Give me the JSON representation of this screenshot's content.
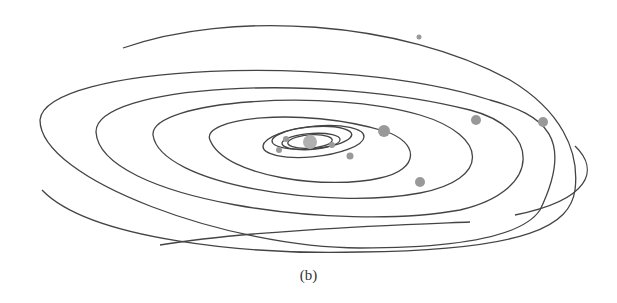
{
  "caption": "(b)",
  "colors": {
    "orbit": "#444444",
    "planet": "#999999",
    "sun": "#b0b0b0",
    "background": "#ffffff"
  },
  "sun": {
    "cx": 310,
    "cy": 142,
    "r": 7
  },
  "orbits": [
    {
      "d": "M 288,142 A 20,6 -4 1 1 332,141 A 20,6 -4 0 1 288,142"
    },
    {
      "d": "M 282,143 A 29,8 -4 1 1 340,140 A 29,8 -4 0 1 282,143"
    },
    {
      "d": "M 275,145 A 40,11 -5 1 1 350,138 A 40,11 -5 0 1 275,145"
    },
    {
      "d": "M 263,146 A 50,15 -6 1 1 364,137 A 50,15 -6 0 1 263,146"
    },
    {
      "d": "M 210,140 C 200,118 300,106 384,131 C 420,142 420,170 380,178 C 330,190 225,178 210,140"
    },
    {
      "d": "M 153,135 C 150,100 330,88 420,115 C 490,136 490,180 420,193 C 330,210 160,185 153,135"
    },
    {
      "d": "M 96,132 C 95,85 320,72 470,110 C 540,128 545,190 460,210 C 340,232 100,200 96,132"
    },
    {
      "d": "M 40,120 C 45,65 340,52 490,100 C 545,115 575,138 540,210 C 520,240 440,248 360,248 C 230,248 40,180 40,120"
    },
    {
      "d": "M 123,48 C 230,10 400,20 510,80 C 560,110 580,150 575,190 C 570,225 530,250 360,252"
    },
    {
      "d": "M 42,190 C 90,240 250,255 360,252"
    },
    {
      "d": "M 160,245 C 250,230 400,225 470,222"
    },
    {
      "d": "M 575,146 C 600,170 590,200 515,215"
    }
  ],
  "planets": [
    {
      "name": "planet-mercury",
      "cx": 279,
      "cy": 150,
      "r": 3
    },
    {
      "name": "planet-venus",
      "cx": 286,
      "cy": 139,
      "r": 3
    },
    {
      "name": "planet-earth",
      "cx": 332,
      "cy": 145,
      "r": 3
    },
    {
      "name": "planet-mars",
      "cx": 350,
      "cy": 156,
      "r": 3.5
    },
    {
      "name": "planet-jupiter",
      "cx": 384,
      "cy": 131,
      "r": 6
    },
    {
      "name": "planet-saturn",
      "cx": 420,
      "cy": 182,
      "r": 5
    },
    {
      "name": "planet-uranus",
      "cx": 476,
      "cy": 120,
      "r": 5
    },
    {
      "name": "planet-neptune",
      "cx": 543,
      "cy": 122,
      "r": 5
    },
    {
      "name": "planet-pluto",
      "cx": 419,
      "cy": 37,
      "r": 2.5
    }
  ]
}
